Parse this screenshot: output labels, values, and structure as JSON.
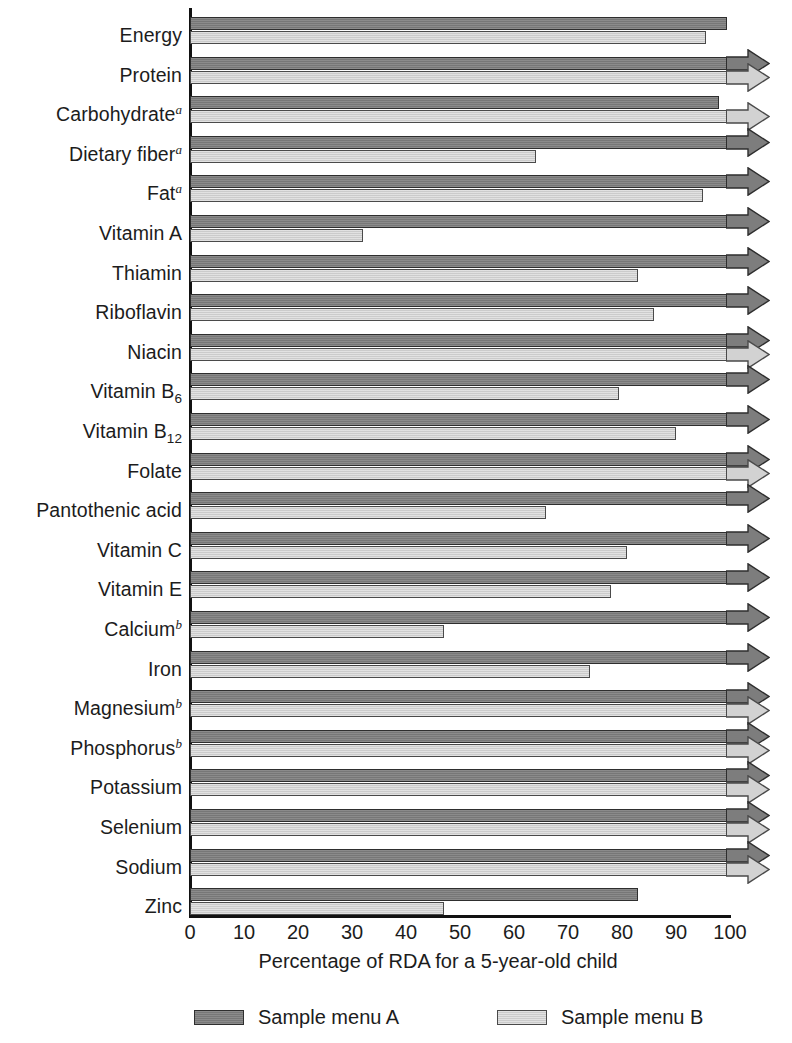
{
  "chart_data": {
    "type": "bar",
    "orientation": "horizontal",
    "title": "",
    "xlabel": "Percentage of RDA for a 5-year-old child",
    "ylabel": "",
    "xlim": [
      0,
      100
    ],
    "xticks": [
      0,
      10,
      20,
      30,
      40,
      50,
      60,
      70,
      80,
      90,
      100
    ],
    "grid": false,
    "legend_position": "bottom",
    "categories": [
      "Energy",
      "Carbohydrate",
      "Protein",
      "Dietary fiber",
      "Fat",
      "Vitamin A",
      "Thiamin",
      "Riboflavin",
      "Niacin",
      "Vitamin B6",
      "Vitamin B12",
      "Folate",
      "Pantothenic acid",
      "Vitamin C",
      "Vitamin E",
      "Calcium",
      "Iron",
      "Magnesium",
      "Phosphorus",
      "Potassium",
      "Selenium",
      "Sodium",
      "Zinc"
    ],
    "category_labels": [
      {
        "text": "Energy",
        "sup": "",
        "sub": ""
      },
      {
        "text": "Protein",
        "sup": "",
        "sub": ""
      },
      {
        "text": "Carbohydrate",
        "sup": "a",
        "sub": ""
      },
      {
        "text": "Dietary fiber",
        "sup": "a",
        "sub": ""
      },
      {
        "text": "Fat",
        "sup": "a",
        "sub": ""
      },
      {
        "text": "Vitamin A",
        "sup": "",
        "sub": ""
      },
      {
        "text": "Thiamin",
        "sup": "",
        "sub": ""
      },
      {
        "text": "Riboflavin",
        "sup": "",
        "sub": ""
      },
      {
        "text": "Niacin",
        "sup": "",
        "sub": ""
      },
      {
        "text": "Vitamin B",
        "sup": "",
        "sub": "6"
      },
      {
        "text": "Vitamin B",
        "sup": "",
        "sub": "12"
      },
      {
        "text": "Folate",
        "sup": "",
        "sub": ""
      },
      {
        "text": "Pantothenic acid",
        "sup": "",
        "sub": ""
      },
      {
        "text": "Vitamin C",
        "sup": "",
        "sub": ""
      },
      {
        "text": "Vitamin E",
        "sup": "",
        "sub": ""
      },
      {
        "text": "Calcium",
        "sup": "b",
        "sub": ""
      },
      {
        "text": "Iron",
        "sup": "",
        "sub": ""
      },
      {
        "text": "Magnesium",
        "sup": "b",
        "sub": ""
      },
      {
        "text": "Phosphorus",
        "sup": "b",
        "sub": ""
      },
      {
        "text": "Potassium",
        "sup": "",
        "sub": ""
      },
      {
        "text": "Selenium",
        "sup": "",
        "sub": ""
      },
      {
        "text": "Sodium",
        "sup": "",
        "sub": ""
      },
      {
        "text": "Zinc",
        "sup": "",
        "sub": ""
      }
    ],
    "series": [
      {
        "name": "Sample menu A",
        "color": "#7d7d7d",
        "values": [
          99.5,
          105,
          98,
          105,
          105,
          105,
          105,
          105,
          105,
          105,
          105,
          105,
          105,
          105,
          105,
          105,
          105,
          105,
          105,
          105,
          105,
          105,
          83
        ],
        "exceeds_axis": [
          false,
          true,
          false,
          true,
          true,
          true,
          true,
          true,
          true,
          true,
          true,
          true,
          true,
          true,
          true,
          true,
          true,
          true,
          true,
          true,
          true,
          true,
          false
        ]
      },
      {
        "name": "Sample menu B",
        "color": "#d2d2d2",
        "values": [
          95.5,
          105,
          105,
          64,
          95,
          32,
          83,
          86,
          105,
          79.5,
          90,
          105,
          66,
          81,
          78,
          47,
          74,
          105,
          105,
          105,
          105,
          105,
          47
        ],
        "exceeds_axis": [
          false,
          true,
          true,
          false,
          false,
          false,
          false,
          false,
          true,
          false,
          false,
          true,
          false,
          false,
          false,
          false,
          false,
          true,
          true,
          true,
          true,
          true,
          false
        ]
      }
    ]
  },
  "legend": {
    "items": [
      {
        "label": "Sample menu A",
        "key": "a"
      },
      {
        "label": "Sample menu B",
        "key": "b"
      }
    ]
  },
  "axis": {
    "x_label": "Percentage of RDA for a 5-year-old child",
    "x_ticks": [
      "0",
      "10",
      "20",
      "30",
      "40",
      "50",
      "60",
      "70",
      "80",
      "90",
      "100"
    ]
  }
}
